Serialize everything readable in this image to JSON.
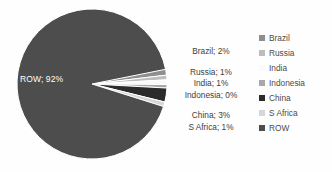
{
  "chart_data": {
    "type": "pie",
    "title": "",
    "categories": [
      "Brazil",
      "Russia",
      "India",
      "Indonesia",
      "China",
      "S Africa",
      "ROW"
    ],
    "values": [
      2,
      1,
      1,
      0,
      3,
      1,
      92
    ],
    "value_unit": "%",
    "labels_shown": true,
    "label_format": "name; value%",
    "legend_position": "right",
    "grid": false,
    "slice_colors": [
      "#8e8e8e",
      "#bdbdbd",
      "#fafafa",
      "#a8a8a8",
      "#2b2b2b",
      "#d6d6d6",
      "#4d4d4d"
    ],
    "slices": [
      {
        "name": "Brazil",
        "value": 2,
        "label": "Brazil; 2%",
        "color": "#8e8e8e"
      },
      {
        "name": "Russia",
        "value": 1,
        "label": "Russia; 1%",
        "color": "#bdbdbd"
      },
      {
        "name": "India",
        "value": 1,
        "label": "India; 1%",
        "color": "#fafafa"
      },
      {
        "name": "Indonesia",
        "value": 0,
        "label": "Indonesia; 0%",
        "color": "#a8a8a8"
      },
      {
        "name": "China",
        "value": 3,
        "label": "China; 3%",
        "color": "#2b2b2b"
      },
      {
        "name": "S Africa",
        "value": 1,
        "label": "S Africa; 1%",
        "color": "#d6d6d6"
      },
      {
        "name": "ROW",
        "value": 92,
        "label": "ROW; 92%",
        "color": "#4d4d4d"
      }
    ]
  },
  "pie": {
    "inner_label": "ROW; 92%"
  },
  "data_labels": [
    {
      "text": "Brazil; 2%"
    },
    {
      "text": "Russia; 1%"
    },
    {
      "text": "India; 1%"
    },
    {
      "text": "Indonesia; 0%"
    },
    {
      "text": "China; 3%"
    },
    {
      "text": "S Africa; 1%"
    }
  ],
  "legend": {
    "items": [
      {
        "label": "Brazil",
        "color": "#8e8e8e"
      },
      {
        "label": "Russia",
        "color": "#bdbdbd"
      },
      {
        "label": "India",
        "color": "#fafafa"
      },
      {
        "label": "Indonesia",
        "color": "#a8a8a8"
      },
      {
        "label": "China",
        "color": "#2b2b2b"
      },
      {
        "label": "S Africa",
        "color": "#d6d6d6"
      },
      {
        "label": "ROW",
        "color": "#4d4d4d"
      }
    ]
  }
}
